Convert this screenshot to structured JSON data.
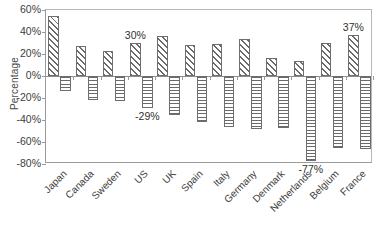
{
  "chart_data": {
    "type": "bar",
    "title": "",
    "subtitle": "",
    "xlabel": "",
    "ylabel": "Percentage",
    "ylim": [
      -80,
      60
    ],
    "grid": false,
    "legend": "none",
    "ytick_labels": [
      "60%",
      "40%",
      "20%",
      "0%",
      "-20%",
      "-40%",
      "-60%",
      "-80%"
    ],
    "ytick_values": [
      60,
      40,
      20,
      0,
      -20,
      -40,
      -60,
      -80
    ],
    "categories": [
      "Japan",
      "Canada",
      "Sweden",
      "US",
      "UK",
      "Spain",
      "Italy",
      "Germany",
      "Denmark",
      "Netherlands",
      "Belgium",
      "France"
    ],
    "series": [
      {
        "name": "Positive",
        "pattern": "diagonal-hatch",
        "values": [
          55,
          27,
          23,
          30,
          36,
          28,
          29,
          34,
          16,
          14,
          30,
          37
        ]
      },
      {
        "name": "Negative",
        "pattern": "horizontal-hatch",
        "values": [
          -14,
          -22,
          -23,
          -29,
          -35,
          -42,
          -46,
          -48,
          -47,
          -77,
          -65,
          -66
        ]
      }
    ],
    "annotations": [
      {
        "text": "30%",
        "category": "US",
        "series": "Positive",
        "value": 30
      },
      {
        "text": "-29%",
        "category": "US",
        "series": "Negative",
        "value": -29
      },
      {
        "text": "-77%",
        "category": "Netherlands",
        "series": "Negative",
        "value": -77
      },
      {
        "text": "37%",
        "category": "France",
        "series": "Positive",
        "value": 37
      }
    ]
  },
  "colors": {
    "axis": "#8c8c8c",
    "bar_outline": "#6e6e6e",
    "hatch": "#6a6a6a",
    "text": "#3a3a3a",
    "background": "#ffffff"
  }
}
